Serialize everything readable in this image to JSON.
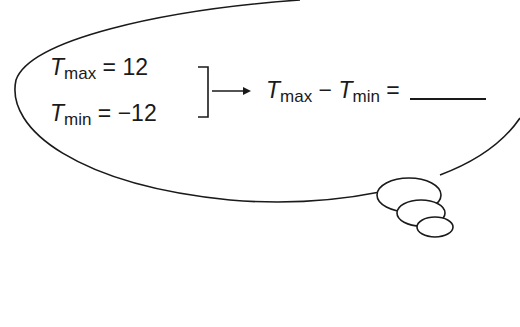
{
  "diagram": {
    "type": "thought-bubble",
    "given": [
      {
        "var": "T",
        "sub": "max",
        "op": "=",
        "value": "12"
      },
      {
        "var": "T",
        "sub": "min",
        "op": "=",
        "value": "−12"
      }
    ],
    "result": {
      "lhs_var1": "T",
      "lhs_sub1": "max",
      "minus": "−",
      "lhs_var2": "T",
      "lhs_sub2": "min",
      "op": "="
    },
    "arrow": "right-arrow"
  }
}
